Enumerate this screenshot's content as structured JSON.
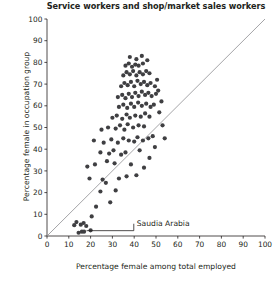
{
  "chart_data": {
    "type": "scatter",
    "title": "Service workers and shop/market sales workers",
    "xlabel": "Percentage female among total employed",
    "ylabel": "Percentage female in occupation group",
    "xlim": [
      0,
      100
    ],
    "ylim": [
      0,
      100
    ],
    "xticks": [
      0,
      10,
      20,
      30,
      40,
      50,
      60,
      70,
      80,
      90,
      100
    ],
    "yticks": [
      0,
      10,
      20,
      30,
      40,
      50,
      60,
      70,
      80,
      90,
      100
    ],
    "xtick_labels": [
      "0",
      "10",
      "20",
      "30",
      "40",
      "50",
      "60",
      "70",
      "80",
      "90",
      "100"
    ],
    "ytick_labels": [
      "0",
      "10",
      "20",
      "30",
      "40",
      "50",
      "60",
      "70",
      "80",
      "90",
      "100"
    ],
    "grid": false,
    "legend": null,
    "marker_color": "#3f3f42",
    "marker_size": 2.1,
    "reference_line": {
      "name": "diagonal-equality-line",
      "x": [
        0,
        100
      ],
      "y": [
        0,
        100
      ],
      "color": "#8d8d90",
      "width": 0.8
    },
    "annotations": [
      {
        "name": "saudia-arabia-annotation",
        "text": "Saudia Arabia",
        "text_x": 40.5,
        "text_y": 6.2,
        "point_x": 17.0,
        "point_y": 2.0
      }
    ],
    "points": [
      [
        14.5,
        1.5
      ],
      [
        16.0,
        2.0
      ],
      [
        17.0,
        2.0
      ],
      [
        20.0,
        2.6
      ],
      [
        12.5,
        5.0
      ],
      [
        15.5,
        5.2
      ],
      [
        18.0,
        4.6
      ],
      [
        13.5,
        6.4
      ],
      [
        16.8,
        6.0
      ],
      [
        20.5,
        9.0
      ],
      [
        22.5,
        13.5
      ],
      [
        29.0,
        15.5
      ],
      [
        24.5,
        20.5
      ],
      [
        31.5,
        21.0
      ],
      [
        19.5,
        26.5
      ],
      [
        25.5,
        26.0
      ],
      [
        27.0,
        24.5
      ],
      [
        33.0,
        26.5
      ],
      [
        36.5,
        27.5
      ],
      [
        18.5,
        32.0
      ],
      [
        22.0,
        33.0
      ],
      [
        27.5,
        34.5
      ],
      [
        31.0,
        33.5
      ],
      [
        38.5,
        33.0
      ],
      [
        24.5,
        38.5
      ],
      [
        28.5,
        38.0
      ],
      [
        30.5,
        39.5
      ],
      [
        34.0,
        37.5
      ],
      [
        36.0,
        38.5
      ],
      [
        42.5,
        39.5
      ],
      [
        21.5,
        44.0
      ],
      [
        26.0,
        43.0
      ],
      [
        29.5,
        44.5
      ],
      [
        32.5,
        43.0
      ],
      [
        35.0,
        45.0
      ],
      [
        37.5,
        44.0
      ],
      [
        40.0,
        43.5
      ],
      [
        41.5,
        45.5
      ],
      [
        44.0,
        44.0
      ],
      [
        46.5,
        45.0
      ],
      [
        48.5,
        46.0
      ],
      [
        25.0,
        49.0
      ],
      [
        28.0,
        50.0
      ],
      [
        31.5,
        49.5
      ],
      [
        33.5,
        51.0
      ],
      [
        35.5,
        49.0
      ],
      [
        37.0,
        51.5
      ],
      [
        39.5,
        50.0
      ],
      [
        42.0,
        51.0
      ],
      [
        44.5,
        50.5
      ],
      [
        30.0,
        54.5
      ],
      [
        32.0,
        55.5
      ],
      [
        34.5,
        54.0
      ],
      [
        36.5,
        56.0
      ],
      [
        38.0,
        54.5
      ],
      [
        40.5,
        55.5
      ],
      [
        43.0,
        55.0
      ],
      [
        45.0,
        56.5
      ],
      [
        47.0,
        55.0
      ],
      [
        33.0,
        59.5
      ],
      [
        35.0,
        60.5
      ],
      [
        36.8,
        59.0
      ],
      [
        38.5,
        61.0
      ],
      [
        40.0,
        59.5
      ],
      [
        41.8,
        61.5
      ],
      [
        43.5,
        60.0
      ],
      [
        45.5,
        61.0
      ],
      [
        47.5,
        59.5
      ],
      [
        49.0,
        60.5
      ],
      [
        32.5,
        64.0
      ],
      [
        34.5,
        65.0
      ],
      [
        36.0,
        63.5
      ],
      [
        37.5,
        65.5
      ],
      [
        39.0,
        64.0
      ],
      [
        40.5,
        66.0
      ],
      [
        42.0,
        64.5
      ],
      [
        43.5,
        66.5
      ],
      [
        45.0,
        65.0
      ],
      [
        46.5,
        66.0
      ],
      [
        48.0,
        64.5
      ],
      [
        50.0,
        65.5
      ],
      [
        34.0,
        69.0
      ],
      [
        35.5,
        70.5
      ],
      [
        37.0,
        69.5
      ],
      [
        38.5,
        71.0
      ],
      [
        40.0,
        69.0
      ],
      [
        41.5,
        71.5
      ],
      [
        43.0,
        70.0
      ],
      [
        44.5,
        71.0
      ],
      [
        46.0,
        69.5
      ],
      [
        47.5,
        70.5
      ],
      [
        49.5,
        69.0
      ],
      [
        35.0,
        74.0
      ],
      [
        36.5,
        75.5
      ],
      [
        38.0,
        74.5
      ],
      [
        39.5,
        76.0
      ],
      [
        41.0,
        74.0
      ],
      [
        42.5,
        75.5
      ],
      [
        44.0,
        74.5
      ],
      [
        45.5,
        76.0
      ],
      [
        47.0,
        75.0
      ],
      [
        36.0,
        78.5
      ],
      [
        37.5,
        79.5
      ],
      [
        39.0,
        78.0
      ],
      [
        40.5,
        79.0
      ],
      [
        42.0,
        78.5
      ],
      [
        44.0,
        79.5
      ],
      [
        38.0,
        82.5
      ],
      [
        41.0,
        81.5
      ],
      [
        46.0,
        81.0
      ],
      [
        43.5,
        83.0
      ],
      [
        51.5,
        57.0
      ],
      [
        52.5,
        62.0
      ],
      [
        53.0,
        51.0
      ],
      [
        50.5,
        72.0
      ],
      [
        51.0,
        67.0
      ],
      [
        54.0,
        45.0
      ],
      [
        49.5,
        41.0
      ],
      [
        47.0,
        36.0
      ],
      [
        44.5,
        31.5
      ],
      [
        41.0,
        28.0
      ]
    ]
  }
}
